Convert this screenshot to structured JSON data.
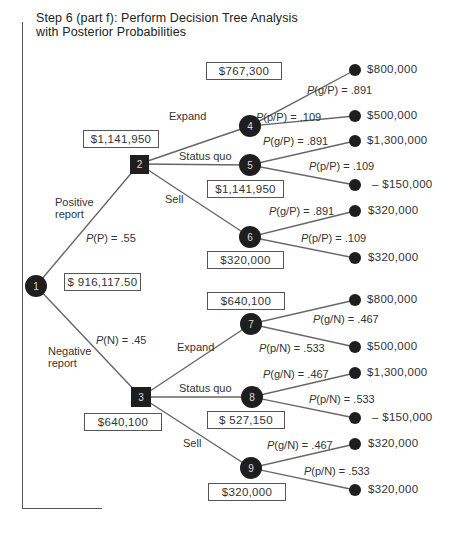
{
  "title": {
    "line1": "Step 6 (part f): Perform Decision Tree Analysis",
    "line2": "with Posterior Probabilities"
  },
  "nodes": {
    "n1": {
      "label": "1",
      "type": "chance",
      "value": "$ 916,117.50"
    },
    "n2": {
      "label": "2",
      "type": "decision",
      "value": "$1,141,950"
    },
    "n3": {
      "label": "3",
      "type": "decision",
      "value": "$640,100"
    },
    "n4": {
      "label": "4",
      "type": "chance",
      "value": "$767,300"
    },
    "n5": {
      "label": "5",
      "type": "chance",
      "value": "$1,141,950"
    },
    "n6": {
      "label": "6",
      "type": "chance",
      "value": "$320,000"
    },
    "n7": {
      "label": "7",
      "type": "chance",
      "value": "$640,100"
    },
    "n8": {
      "label": "8",
      "type": "chance",
      "value": "$ 527,150"
    },
    "n9": {
      "label": "9",
      "type": "chance",
      "value": "$320,000"
    }
  },
  "branches": {
    "positive": {
      "label_line1": "Positive",
      "label_line2": "report",
      "prob": "P(P) = .55"
    },
    "negative": {
      "label_line1": "Negative",
      "label_line2": "report",
      "prob": "P(N) = .45"
    },
    "expand_p": "Expand",
    "status_quo_p": "Status quo",
    "sell_p": "Sell",
    "expand_n": "Expand",
    "status_quo_n": "Status quo",
    "sell_n": "Sell"
  },
  "probabilities": {
    "n4_g": "P(g/P) = .891",
    "n4_p": "P(p/P) = .109",
    "n5_g": "P(g/P) = .891",
    "n5_p": "P(p/P) = .109",
    "n6_g": "P(g/P) = .891",
    "n6_p": "P(p/P) = .109",
    "n7_g": "P(g/N) = .467",
    "n7_p": "P(p/N) = .533",
    "n8_g": "P(g/N) = .467",
    "n8_p": "P(p/N) = .533",
    "n9_g": "P(g/N) = .467",
    "n9_p": "P(p/N) = .533"
  },
  "payoffs": {
    "t1": "$800,000",
    "t2": "$500,000",
    "t3": "$1,300,000",
    "t4": "– $150,000",
    "t5": "$320,000",
    "t6": "$320,000",
    "t7": "$800,000",
    "t8": "$500,000",
    "t9": "$1,300,000",
    "t10": "– $150,000",
    "t11": "$320,000",
    "t12": "$320,000"
  },
  "colors": {
    "node_fill": "#1e1e1e",
    "line": "#666666",
    "text": "#333333"
  }
}
